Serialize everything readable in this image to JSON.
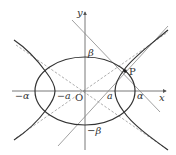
{
  "figure": {
    "type": "geometry-diagram",
    "axes": {
      "x_label": "x",
      "y_label": "y",
      "origin_label": "O"
    },
    "labels": {
      "ellipse_left": "−α",
      "hyperbola_left": "−a",
      "hyperbola_right": "a",
      "ellipse_right": "α",
      "ellipse_top": "β",
      "ellipse_bottom": "−β",
      "point": "P"
    },
    "colors": {
      "curve": "#333333",
      "axis": "#555555",
      "tangent": "#888888",
      "asymptote": "#999999"
    }
  }
}
